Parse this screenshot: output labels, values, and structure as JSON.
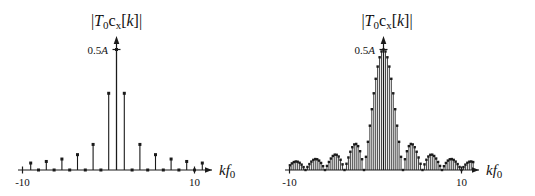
{
  "figure": {
    "background_color": "#ffffff",
    "ink_color": "#1a1a1a"
  },
  "panels": [
    {
      "id": "left",
      "title": "|T0cx[k]|",
      "title_parts": {
        "bar_left": "|",
        "T": "T",
        "T_sub": "0",
        "c": "c",
        "c_sub": "x",
        "bracket": "[k]",
        "bar_right": "|"
      },
      "ylabel_tick": "0.5A",
      "xlabel": "kf0",
      "xlabel_parts": {
        "k": "k",
        "f": "f",
        "f_sub": "0"
      },
      "xticks": [
        {
          "value": -10,
          "label": "-10"
        },
        {
          "value": 10,
          "label": "10"
        }
      ]
    },
    {
      "id": "right",
      "title": "|T0cx[k]|",
      "title_parts": {
        "bar_left": "|",
        "T": "T",
        "T_sub": "0",
        "c": "c",
        "c_sub": "x",
        "bracket": "[k]",
        "bar_right": "|"
      },
      "ylabel_tick": "0.5A",
      "xlabel": "kf0",
      "xlabel_parts": {
        "k": "k",
        "f": "f",
        "f_sub": "0"
      },
      "xticks": [
        {
          "value": -10,
          "label": "-10"
        },
        {
          "value": 10,
          "label": "10"
        }
      ]
    }
  ],
  "chart_data": [
    {
      "type": "bar",
      "id": "left-spectrum",
      "title": "|T0cx[k]|",
      "xlabel": "kf0",
      "ylabel": "",
      "xlim": [
        -11.6,
        11.6
      ],
      "ylim": [
        0,
        0.56
      ],
      "ytick_values": [
        0.5
      ],
      "ytick_labels": [
        "0.5A"
      ],
      "xtick_values": [
        -10,
        10
      ],
      "xtick_labels": [
        "-10",
        "10"
      ],
      "grid": false,
      "legend": null,
      "marker": "square",
      "stem_style": "stem-with-square-marker",
      "description": "Magnitude spectrum of 50% duty-cycle rectangular pulse train: sinc envelope sampled at integer k, zeros at all even k except 0.",
      "x": [
        -11,
        -10,
        -9,
        -8,
        -7,
        -6,
        -5,
        -4,
        -3,
        -2,
        -1,
        0,
        1,
        2,
        3,
        4,
        5,
        6,
        7,
        8,
        9,
        10,
        11
      ],
      "values": [
        0.0289,
        0,
        0.0354,
        0,
        0.0455,
        0,
        0.0637,
        0,
        0.1061,
        0,
        0.3183,
        0.5,
        0.3183,
        0,
        0.1061,
        0,
        0.0637,
        0,
        0.0455,
        0,
        0.0354,
        0,
        0.0289
      ]
    },
    {
      "type": "bar",
      "id": "right-spectrum",
      "title": "|T0cx[k]|",
      "xlabel": "kf0",
      "ylabel": "",
      "xlim": [
        -11.6,
        11.6
      ],
      "ylim": [
        0,
        0.56
      ],
      "ytick_values": [
        0.5
      ],
      "ytick_labels": [
        "0.5A"
      ],
      "xtick_values": [
        -10,
        10
      ],
      "xtick_labels": [
        "-10",
        "10"
      ],
      "grid": false,
      "legend": null,
      "marker": "square",
      "stem_style": "dense-stem-with-square-marker",
      "description": "Magnitude spectrum of narrow pulse train with 10x longer period: dense sinc |0.5A*sinc(k/10)| sampled every 0.25 in kf0, main lobe between -2.5 and 2.5, side lobes decaying outward.",
      "sinc_scale": 0.5,
      "sinc_first_zero": 2.5,
      "sample_spacing": 0.25
    }
  ]
}
